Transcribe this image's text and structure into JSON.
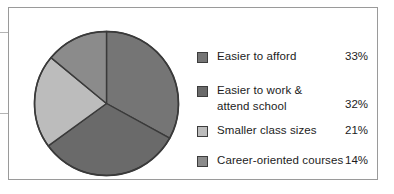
{
  "chart_data": {
    "type": "pie",
    "title": "",
    "subtitle": "",
    "categories": [
      "Easier to afford",
      "Easier to work & attend school",
      "Smaller class sizes",
      "Career-oriented courses"
    ],
    "values": [
      33,
      32,
      21,
      14
    ],
    "value_labels": [
      "33%",
      "32%",
      "21%",
      "14%"
    ],
    "unit": "%",
    "legend_position": "right",
    "start_angle_deg": 0,
    "direction": "clockwise",
    "grid": false,
    "colors": [
      "#757575",
      "#6a6a6a",
      "#bcbcbc",
      "#8b8b8b"
    ],
    "slice_border_color": "#3a3a3a",
    "slices": [
      {
        "label": "Easier to afford",
        "value": 33,
        "value_label": "33%",
        "color": "#757575"
      },
      {
        "label": "Easier to work & attend school",
        "value": 32,
        "value_label": "32%",
        "color": "#6a6a6a"
      },
      {
        "label": "Smaller class sizes",
        "value": 21,
        "value_label": "21%",
        "color": "#bcbcbc"
      },
      {
        "label": "Career-oriented courses",
        "value": 14,
        "value_label": "14%",
        "color": "#8b8b8b"
      }
    ]
  },
  "legend": {
    "rows": [
      {
        "label": "Easier to afford",
        "label_line2": "",
        "value": "33%",
        "color": "#757575"
      },
      {
        "label": "Easier to work &",
        "label_line2": "attend school",
        "value": "32%",
        "color": "#6a6a6a"
      },
      {
        "label": "Smaller class sizes",
        "label_line2": "",
        "value": "21%",
        "color": "#bcbcbc"
      },
      {
        "label": "Career-oriented courses",
        "label_line2": "",
        "value": "14%",
        "color": "#8b8b8b"
      }
    ]
  },
  "frame": {
    "border_color": "#9a9a9a",
    "background": "#ffffff"
  },
  "callouts": {
    "line_color": "#b4b4b4",
    "dot_color": "#b8b8b8",
    "count": 2
  }
}
